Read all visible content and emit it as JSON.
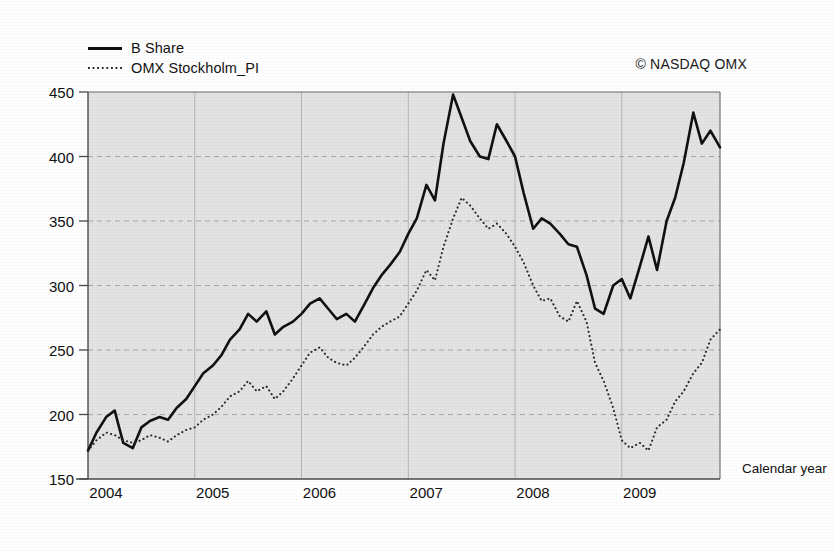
{
  "chart_data": {
    "type": "line",
    "title": "",
    "xlabel": "Calendar year",
    "ylabel": "",
    "attribution": "© NASDAQ OMX",
    "grid": true,
    "legend_position": "top-left",
    "ylim": [
      150,
      450
    ],
    "yticks": [
      150,
      200,
      250,
      300,
      350,
      400,
      450
    ],
    "xlim": [
      2004.0,
      2009.92
    ],
    "xticks": [
      2004,
      2005,
      2006,
      2007,
      2008,
      2009
    ],
    "xtick_labels": [
      "2004",
      "2005",
      "2006",
      "2007",
      "2008",
      "2009"
    ],
    "series": [
      {
        "name": "B Share",
        "style": "solid",
        "color": "#111111",
        "x": [
          2004.0,
          2004.08,
          2004.17,
          2004.25,
          2004.33,
          2004.42,
          2004.5,
          2004.58,
          2004.67,
          2004.75,
          2004.83,
          2004.92,
          2005.0,
          2005.08,
          2005.17,
          2005.25,
          2005.33,
          2005.42,
          2005.5,
          2005.58,
          2005.67,
          2005.75,
          2005.83,
          2005.92,
          2006.0,
          2006.08,
          2006.17,
          2006.25,
          2006.33,
          2006.42,
          2006.5,
          2006.58,
          2006.67,
          2006.75,
          2006.83,
          2006.92,
          2007.0,
          2007.08,
          2007.17,
          2007.25,
          2007.33,
          2007.42,
          2007.5,
          2007.58,
          2007.67,
          2007.75,
          2007.83,
          2007.92,
          2008.0,
          2008.08,
          2008.17,
          2008.25,
          2008.33,
          2008.42,
          2008.5,
          2008.58,
          2008.67,
          2008.75,
          2008.83,
          2008.92,
          2009.0,
          2009.08,
          2009.17,
          2009.25,
          2009.33,
          2009.42,
          2009.5,
          2009.58,
          2009.67,
          2009.75,
          2009.83,
          2009.92
        ],
        "values": [
          172,
          186,
          198,
          203,
          178,
          174,
          190,
          195,
          198,
          196,
          205,
          212,
          222,
          232,
          238,
          246,
          258,
          266,
          278,
          272,
          280,
          262,
          268,
          272,
          278,
          286,
          290,
          282,
          274,
          278,
          272,
          284,
          298,
          308,
          316,
          326,
          340,
          352,
          378,
          366,
          410,
          448,
          430,
          412,
          400,
          398,
          425,
          412,
          400,
          372,
          344,
          352,
          348,
          340,
          332,
          330,
          308,
          282,
          278,
          300,
          305,
          290,
          315,
          338,
          312,
          350,
          368,
          395,
          434,
          410,
          420,
          407
        ]
      },
      {
        "name": "OMX Stockholm_PI",
        "style": "dotted",
        "color": "#2b2b2b",
        "x": [
          2004.0,
          2004.08,
          2004.17,
          2004.25,
          2004.33,
          2004.42,
          2004.5,
          2004.58,
          2004.67,
          2004.75,
          2004.83,
          2004.92,
          2005.0,
          2005.08,
          2005.17,
          2005.25,
          2005.33,
          2005.42,
          2005.5,
          2005.58,
          2005.67,
          2005.75,
          2005.83,
          2005.92,
          2006.0,
          2006.08,
          2006.17,
          2006.25,
          2006.33,
          2006.42,
          2006.5,
          2006.58,
          2006.67,
          2006.75,
          2006.83,
          2006.92,
          2007.0,
          2007.08,
          2007.17,
          2007.25,
          2007.33,
          2007.42,
          2007.5,
          2007.58,
          2007.67,
          2007.75,
          2007.83,
          2007.92,
          2008.0,
          2008.08,
          2008.17,
          2008.25,
          2008.33,
          2008.42,
          2008.5,
          2008.58,
          2008.67,
          2008.75,
          2008.83,
          2008.92,
          2009.0,
          2009.08,
          2009.17,
          2009.25,
          2009.33,
          2009.42,
          2009.5,
          2009.58,
          2009.67,
          2009.75,
          2009.83,
          2009.92
        ],
        "values": [
          172,
          180,
          186,
          184,
          180,
          178,
          180,
          184,
          182,
          179,
          184,
          188,
          190,
          196,
          200,
          206,
          214,
          218,
          226,
          218,
          222,
          212,
          218,
          228,
          238,
          248,
          252,
          244,
          240,
          238,
          244,
          252,
          262,
          268,
          272,
          276,
          286,
          296,
          312,
          304,
          330,
          352,
          368,
          362,
          352,
          344,
          348,
          340,
          330,
          318,
          300,
          288,
          290,
          276,
          272,
          288,
          272,
          240,
          226,
          205,
          180,
          174,
          178,
          172,
          190,
          196,
          210,
          218,
          232,
          240,
          258,
          266
        ]
      }
    ]
  },
  "legend": {
    "items": [
      {
        "label": "B Share",
        "style": "solid"
      },
      {
        "label": "OMX Stockholm_PI",
        "style": "dotted"
      }
    ]
  },
  "axes": {
    "x_title": "Calendar year"
  },
  "colors": {
    "plot_background": "#e3e3e3",
    "grid": "#9a9a9a",
    "axis": "#4a4a4a",
    "series_primary": "#111111",
    "series_secondary": "#2b2b2b"
  }
}
